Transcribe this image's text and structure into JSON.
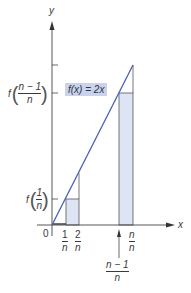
{
  "diagram": {
    "function_label": "f(x) = 2x",
    "axes": {
      "x_label": "x",
      "y_label": "y",
      "origin_label": "0"
    },
    "y_ticks": [
      {
        "label_func": "f",
        "numerator": "1",
        "denominator": "n"
      },
      {
        "label_func": "f",
        "numerator": "n − 1",
        "denominator": "n"
      }
    ],
    "x_ticks": [
      {
        "numerator": "1",
        "denominator": "n"
      },
      {
        "numerator": "2",
        "denominator": "n"
      },
      {
        "numerator": "n",
        "denominator": "n"
      }
    ],
    "arrow_label": {
      "numerator": "n − 1",
      "denominator": "n"
    },
    "colors": {
      "line": "#4a5fb5",
      "bar_fill": "#dde5f5",
      "bar_stroke": "#555555",
      "axis": "#444444",
      "label_bg": "#c9d3ef"
    }
  }
}
